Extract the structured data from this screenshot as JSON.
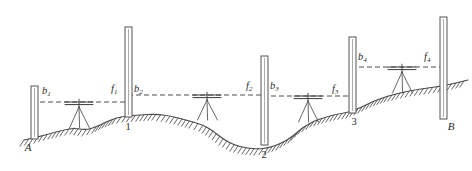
{
  "figure": {
    "domain_note": "surveying leveling run diagram",
    "background_color": "#ffffff",
    "line_color": "#4a4a4a",
    "label_color": "#2b2b2b"
  },
  "endpoints": [
    {
      "id": "A",
      "label": "A",
      "x": 28,
      "y": 151,
      "role": "benchmark-start"
    },
    {
      "id": "B",
      "label": "B",
      "x": 451,
      "y": 130,
      "role": "benchmark-end"
    }
  ],
  "turning_points": [
    {
      "id": "tp1",
      "label": "1",
      "x": 128,
      "y": 130
    },
    {
      "id": "tp2",
      "label": "2",
      "x": 264,
      "y": 158
    },
    {
      "id": "tp3",
      "label": "3",
      "x": 354,
      "y": 125
    }
  ],
  "staffs": [
    {
      "id": "staff-a",
      "x": 31,
      "top": 86,
      "bottom": 139,
      "width": 7,
      "at": "A"
    },
    {
      "id": "staff-1",
      "x": 125,
      "top": 27,
      "bottom": 117,
      "width": 7,
      "at": "1"
    },
    {
      "id": "staff-2",
      "x": 261,
      "top": 56,
      "bottom": 145,
      "width": 7,
      "at": "2"
    },
    {
      "id": "staff-3",
      "x": 349,
      "top": 37,
      "bottom": 113,
      "width": 7,
      "at": "3"
    },
    {
      "id": "staff-b",
      "x": 440,
      "top": 17,
      "bottom": 119,
      "width": 7,
      "at": "B"
    }
  ],
  "instruments": [
    {
      "id": "level-1",
      "x": 79,
      "bar_y": 102,
      "ground_y": 128,
      "bar_half": 14,
      "setup": "between A and 1"
    },
    {
      "id": "level-2",
      "x": 207,
      "bar_y": 95,
      "ground_y": 120,
      "bar_half": 14,
      "setup": "between 1 and 2"
    },
    {
      "id": "level-3",
      "x": 308,
      "bar_y": 96,
      "ground_y": 122,
      "bar_half": 14,
      "setup": "between 2 and 3"
    },
    {
      "id": "level-4",
      "x": 402,
      "bar_y": 67,
      "ground_y": 93,
      "bar_half": 14,
      "setup": "between 3 and B"
    }
  ],
  "sight_lines": [
    {
      "id": "sight-1",
      "x1": 32,
      "x2": 129,
      "y": 102
    },
    {
      "id": "sight-2",
      "x1": 128,
      "x2": 265,
      "y": 95
    },
    {
      "id": "sight-3",
      "x1": 263,
      "x2": 353,
      "y": 96
    },
    {
      "id": "sight-4",
      "x1": 351,
      "x2": 443,
      "y": 67
    }
  ],
  "readings": [
    {
      "id": "b1",
      "base": "b",
      "sub": "1",
      "kind": "backsight",
      "x": 42,
      "y": 94,
      "station": "A"
    },
    {
      "id": "f1",
      "base": "f",
      "sub": "1",
      "kind": "foresight",
      "x": 111,
      "y": 92,
      "station": "1"
    },
    {
      "id": "b2",
      "base": "b",
      "sub": "2",
      "kind": "backsight",
      "x": 134,
      "y": 92,
      "station": "1"
    },
    {
      "id": "f2",
      "base": "f",
      "sub": "2",
      "kind": "foresight",
      "x": 246,
      "y": 89,
      "station": "2"
    },
    {
      "id": "b3",
      "base": "b",
      "sub": "3",
      "kind": "backsight",
      "x": 270,
      "y": 89,
      "station": "2"
    },
    {
      "id": "f3",
      "base": "f",
      "sub": "3",
      "kind": "foresight",
      "x": 332,
      "y": 92,
      "station": "3"
    },
    {
      "id": "b4",
      "base": "b",
      "sub": "4",
      "kind": "backsight",
      "x": 358,
      "y": 60,
      "station": "3"
    },
    {
      "id": "f4",
      "base": "f",
      "sub": "4",
      "kind": "foresight",
      "x": 424,
      "y": 60,
      "station": "B"
    }
  ],
  "ground_profile": {
    "description": "Undulating terrain: low at A, rise to point 1, dip to low point 2, then rise through 3 to B",
    "points": [
      [
        24,
        140
      ],
      [
        38,
        137
      ],
      [
        52,
        133
      ],
      [
        64,
        130
      ],
      [
        74,
        128
      ],
      [
        86,
        130
      ],
      [
        96,
        127
      ],
      [
        106,
        122
      ],
      [
        116,
        118
      ],
      [
        126,
        116
      ],
      [
        140,
        115
      ],
      [
        156,
        114
      ],
      [
        170,
        116
      ],
      [
        182,
        119
      ],
      [
        193,
        122
      ],
      [
        203,
        125
      ],
      [
        213,
        131
      ],
      [
        223,
        139
      ],
      [
        234,
        145
      ],
      [
        246,
        148
      ],
      [
        258,
        149
      ],
      [
        268,
        148
      ],
      [
        280,
        144
      ],
      [
        292,
        137
      ],
      [
        302,
        128
      ],
      [
        314,
        121
      ],
      [
        326,
        117
      ],
      [
        338,
        114
      ],
      [
        350,
        112
      ],
      [
        362,
        107
      ],
      [
        374,
        101
      ],
      [
        388,
        96
      ],
      [
        400,
        93
      ],
      [
        414,
        90
      ],
      [
        428,
        88
      ],
      [
        442,
        86
      ],
      [
        456,
        83
      ],
      [
        468,
        80
      ]
    ]
  }
}
